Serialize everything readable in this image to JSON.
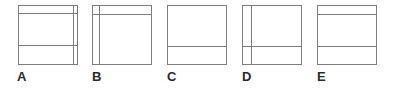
{
  "panel": {
    "name": "figure-comparison-panel",
    "background_color": "#ffffff",
    "line_color": "#7d7d7d",
    "label_color": "#2b2b2b"
  },
  "figures": [
    {
      "label": "A",
      "left": 18,
      "size": 60,
      "label_left": 17,
      "horizontal_lines": [
        7,
        39
      ],
      "vertical_lines": [
        54
      ]
    },
    {
      "label": "B",
      "left": 92,
      "size": 60,
      "label_left": 92,
      "horizontal_lines": [
        8
      ],
      "vertical_lines": [
        6
      ]
    },
    {
      "label": "C",
      "left": 167,
      "size": 60,
      "label_left": 167,
      "horizontal_lines": [
        40
      ],
      "vertical_lines": []
    },
    {
      "label": "D",
      "left": 242,
      "size": 60,
      "label_left": 242,
      "horizontal_lines": [
        40
      ],
      "vertical_lines": [
        8
      ]
    },
    {
      "label": "E",
      "left": 317,
      "size": 60,
      "label_left": 317,
      "horizontal_lines": [
        8,
        40
      ],
      "vertical_lines": []
    }
  ]
}
